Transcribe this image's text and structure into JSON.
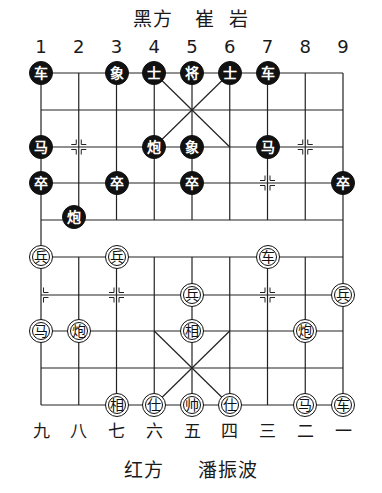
{
  "header": {
    "side_label": "黑方",
    "player_given": "崔",
    "player_family": "岩"
  },
  "footer": {
    "side_label": "红方",
    "player_name": "潘振波"
  },
  "files_top": [
    "1",
    "2",
    "3",
    "4",
    "5",
    "6",
    "7",
    "8",
    "9"
  ],
  "files_bottom": [
    "九",
    "八",
    "七",
    "六",
    "五",
    "四",
    "三",
    "二",
    "一"
  ],
  "pieces": [
    {
      "side": "black",
      "char": "车",
      "file": 1,
      "rank": 0
    },
    {
      "side": "black",
      "char": "象",
      "file": 3,
      "rank": 0
    },
    {
      "side": "black",
      "char": "士",
      "file": 4,
      "rank": 0
    },
    {
      "side": "black",
      "char": "将",
      "file": 5,
      "rank": 0
    },
    {
      "side": "black",
      "char": "士",
      "file": 6,
      "rank": 0
    },
    {
      "side": "black",
      "char": "车",
      "file": 7,
      "rank": 0
    },
    {
      "side": "black",
      "char": "马",
      "file": 1,
      "rank": 2
    },
    {
      "side": "black",
      "char": "炮",
      "file": 4,
      "rank": 2
    },
    {
      "side": "black",
      "char": "象",
      "file": 5,
      "rank": 2
    },
    {
      "side": "black",
      "char": "马",
      "file": 7,
      "rank": 2
    },
    {
      "side": "black",
      "char": "卒",
      "file": 1,
      "rank": 3
    },
    {
      "side": "black",
      "char": "卒",
      "file": 3,
      "rank": 3
    },
    {
      "side": "black",
      "char": "卒",
      "file": 5,
      "rank": 3
    },
    {
      "side": "black",
      "char": "卒",
      "file": 9,
      "rank": 3
    },
    {
      "side": "black",
      "char": "炮",
      "file": 2,
      "rank": 4
    },
    {
      "side": "red",
      "char": "兵",
      "file": 1,
      "rank": 5
    },
    {
      "side": "red",
      "char": "兵",
      "file": 3,
      "rank": 5
    },
    {
      "side": "red",
      "char": "车",
      "file": 7,
      "rank": 5
    },
    {
      "side": "red",
      "char": "兵",
      "file": 5,
      "rank": 6
    },
    {
      "side": "red",
      "char": "兵",
      "file": 9,
      "rank": 6
    },
    {
      "side": "red",
      "char": "马",
      "file": 1,
      "rank": 7
    },
    {
      "side": "red",
      "char": "炮",
      "file": 2,
      "rank": 7
    },
    {
      "side": "red",
      "char": "相",
      "file": 5,
      "rank": 7
    },
    {
      "side": "red",
      "char": "炮",
      "file": 8,
      "rank": 7
    },
    {
      "side": "red",
      "char": "相",
      "file": 3,
      "rank": 9
    },
    {
      "side": "red",
      "char": "仕",
      "file": 4,
      "rank": 9
    },
    {
      "side": "red",
      "char": "帅",
      "file": 5,
      "rank": 9
    },
    {
      "side": "red",
      "char": "仕",
      "file": 6,
      "rank": 9
    },
    {
      "side": "red",
      "char": "马",
      "file": 8,
      "rank": 9
    },
    {
      "side": "red",
      "char": "车",
      "file": 9,
      "rank": 9
    }
  ]
}
